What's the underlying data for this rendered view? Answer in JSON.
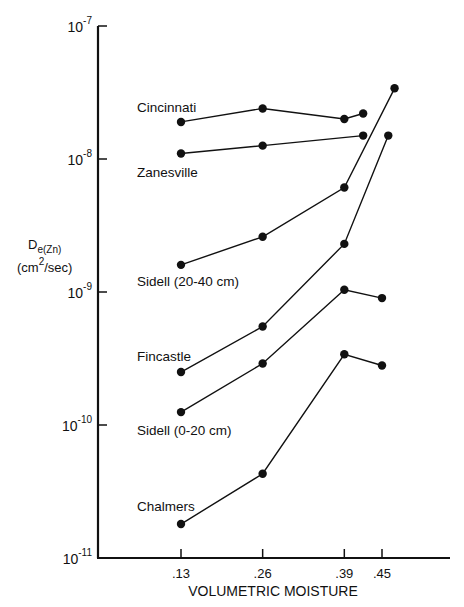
{
  "chart_data": {
    "type": "line",
    "title": "",
    "xlabel": "VOLUMETRIC MOISTURE",
    "ylabel": "D e(Zn) (cm2/sec)",
    "ylabel_main": "D",
    "ylabel_sub": "e(Zn)",
    "ylabel_units_pre": "(cm",
    "ylabel_units_sup": "2",
    "ylabel_units_post": "/sec)",
    "yscale": "log",
    "ylim": [
      1e-11,
      1e-07
    ],
    "y_ticks": [
      {
        "value": 1e-07,
        "base": "10",
        "exp": "-7"
      },
      {
        "value": 1e-08,
        "base": "10",
        "exp": "-8"
      },
      {
        "value": 1e-09,
        "base": "10",
        "exp": "-9"
      },
      {
        "value": 1e-10,
        "base": "10",
        "exp": "-10"
      },
      {
        "value": 1e-11,
        "base": "10",
        "exp": "-11"
      }
    ],
    "x_ticks": [
      {
        "value": 0.13,
        "label": ".13"
      },
      {
        "value": 0.26,
        "label": ".26"
      },
      {
        "value": 0.39,
        "label": ".39"
      },
      {
        "value": 0.45,
        "label": ".45"
      }
    ],
    "grid": false,
    "legend": "inline labels left of each series",
    "series": [
      {
        "name": "Cincinnati",
        "x": [
          0.13,
          0.26,
          0.39,
          0.42
        ],
        "y": [
          1.9e-08,
          2.4e-08,
          2e-08,
          2.2e-08
        ]
      },
      {
        "name": "Zanesville",
        "x": [
          0.13,
          0.26,
          0.42
        ],
        "y": [
          1.1e-08,
          1.26e-08,
          1.5e-08
        ]
      },
      {
        "name": "Sidell (20-40 cm)",
        "x": [
          0.13,
          0.26,
          0.39,
          0.47
        ],
        "y": [
          1.6e-09,
          2.6e-09,
          6.1e-09,
          3.4e-08
        ]
      },
      {
        "name": "Fincastle",
        "x": [
          0.13,
          0.26,
          0.39,
          0.46
        ],
        "y": [
          2.5e-10,
          5.5e-10,
          2.3e-09,
          1.5e-08
        ]
      },
      {
        "name": "Sidell (0-20 cm)",
        "x": [
          0.13,
          0.26,
          0.39,
          0.45
        ],
        "y": [
          1.25e-10,
          2.9e-10,
          1.04e-09,
          9e-10
        ]
      },
      {
        "name": "Chalmers",
        "x": [
          0.13,
          0.26,
          0.39,
          0.45
        ],
        "y": [
          1.8e-11,
          4.3e-11,
          3.4e-10,
          2.8e-10
        ]
      }
    ]
  }
}
